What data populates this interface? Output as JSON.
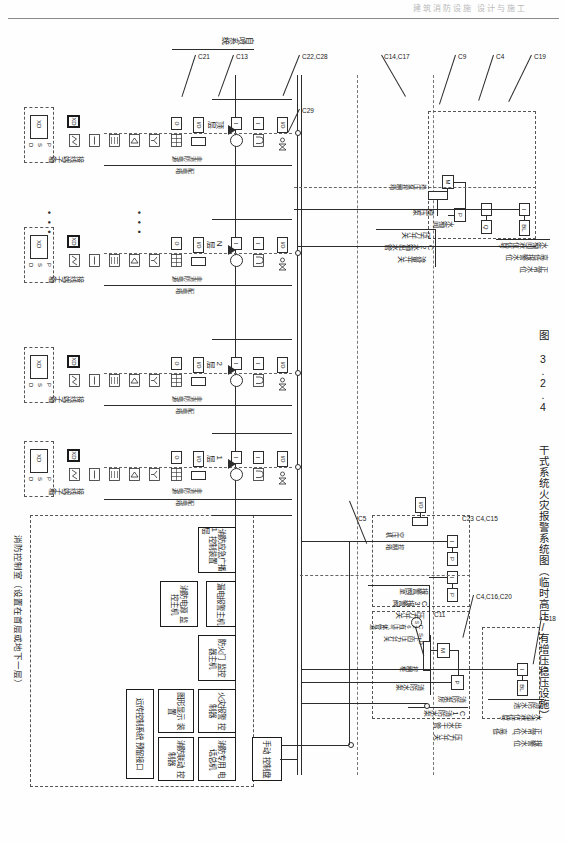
{
  "page": {
    "header_faint": "建筑消防设施 设计与施工",
    "figure_number": "图 3.2.4",
    "figure_title": "干式系统火灾报警系统图（临时高压/有增压稳压设施）"
  },
  "floors": [
    {
      "label": "顶层"
    },
    {
      "label": "N层"
    },
    {
      "label": "2层"
    },
    {
      "label": "1层"
    },
    {
      "label": "-1层"
    }
  ],
  "top_section": {
    "water_tank_room": {
      "room_label": "水箱间",
      "pump_label": "稳压泵",
      "cabinet_label": "稳压泵\n控制箱",
      "pressure_switch": "压力开关",
      "flow_switch_code": "C2水箱出水管",
      "flow_switch": "流量开关",
      "level_signal": "水箱间液位信号",
      "level_alarm": "高低报警水位",
      "level_normal": "正常水位",
      "motor_symbol": "M",
      "pressure_symbol": "P",
      "io_symbol": "I",
      "flow_symbol": "Q",
      "level_symbol": "BL"
    },
    "codes": [
      "C19",
      "C4",
      "C9",
      "C14,C17",
      "C22,C28",
      "C29",
      "C13",
      "C21"
    ]
  },
  "right_section": {
    "fire_tank": {
      "code": "C18",
      "name": "消防水池",
      "signal": "水池液位信号",
      "normal": "正常水位、高低",
      "alarm": "报警水位",
      "symbol_i": "I",
      "symbol_bl": "BL"
    },
    "pump_room": {
      "code": "C4,C16,C20",
      "name": "消防泵房",
      "pump_name": "消防水泵",
      "cabinet": "消防水泵\n控制柜",
      "main_pipe_code": "C1消防水泵",
      "main_pipe": "出水干管",
      "pressure_switch": "压力开关",
      "symbol_m": "M",
      "symbol_p": "P",
      "symbol_s": "S",
      "symbol_d": "D",
      "code_c11": "C11",
      "code_c5": "C5"
    },
    "alarm_valve_room": {
      "name": "报警阀室",
      "valve_code": "C3报警阀",
      "valve_switch": "压力开关",
      "gas_code": "C26有压气体管道",
      "gas_switch": "上的压力开关",
      "codes": "C23 C4,C15",
      "compressor": "空压机\n控制箱",
      "symbol_i": "I",
      "symbol_p": "P",
      "symbol_io": "I/O"
    }
  },
  "floor_module": {
    "terminal_box": "接线端子箱",
    "xd_label": "XD",
    "xd_ports": [
      "P",
      "S",
      "D"
    ],
    "non_fire_power": "非消防电源\n配电箱",
    "devices": [
      {
        "name": "manual-call-point",
        "glyph": "Y"
      },
      {
        "name": "sound-light-alarm",
        "glyph": "◁"
      },
      {
        "name": "module-box",
        "glyph": "▦"
      },
      {
        "name": "smoke-detector",
        "glyph": "▭"
      },
      {
        "name": "heat-detector",
        "glyph": "∿"
      }
    ],
    "io_label": "I/O",
    "valve_label": "⋈",
    "bell_label": "I"
  },
  "sprinkler_label": "自喷系统",
  "control_room": {
    "title": "消防控制室（设置在首层或地下一层）",
    "units": [
      {
        "id": "broadcast",
        "label": "消防应急广播\n控制装置"
      },
      {
        "id": "leakage-alarm",
        "label": "漏电报警主机"
      },
      {
        "id": "power-monitor",
        "label": "消防电源\n监控主机"
      },
      {
        "id": "fire-door",
        "label": "防火门\n监控器主机"
      },
      {
        "id": "fire-alarm-ctrl",
        "label": "火灾报警\n控制器"
      },
      {
        "id": "phone-host",
        "label": "消防专用\n电话总机"
      },
      {
        "id": "linkage-ctrl",
        "label": "消防联动\n控制器"
      },
      {
        "id": "manual-panel",
        "label": "手动\n控制盘"
      },
      {
        "id": "graphic-display",
        "label": "图形显示\n装置"
      },
      {
        "id": "remote-system",
        "label": "远传控制系统\n预留接口"
      }
    ]
  },
  "colors": {
    "line": "#2c2c2c",
    "dash": "#555555",
    "paper": "#fefefe",
    "faint": "#b9b9b9"
  }
}
